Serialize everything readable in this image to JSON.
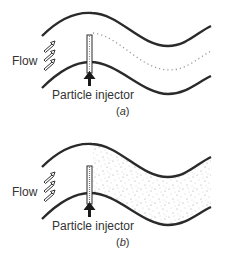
{
  "figure": {
    "panels": [
      {
        "id": "a",
        "caption_open": "(",
        "caption_letter": "a",
        "caption_close": ")",
        "flow_label": "Flow",
        "injector_label": "Particle injector",
        "particle_pattern": "streakline"
      },
      {
        "id": "b",
        "caption_open": "(",
        "caption_letter": "b",
        "caption_close": ")",
        "flow_label": "Flow",
        "injector_label": "Particle injector",
        "particle_pattern": "dispersed"
      }
    ],
    "colors": {
      "wall": "#2a2a2a",
      "particles": "#9a9a9a",
      "text": "#333333"
    }
  }
}
